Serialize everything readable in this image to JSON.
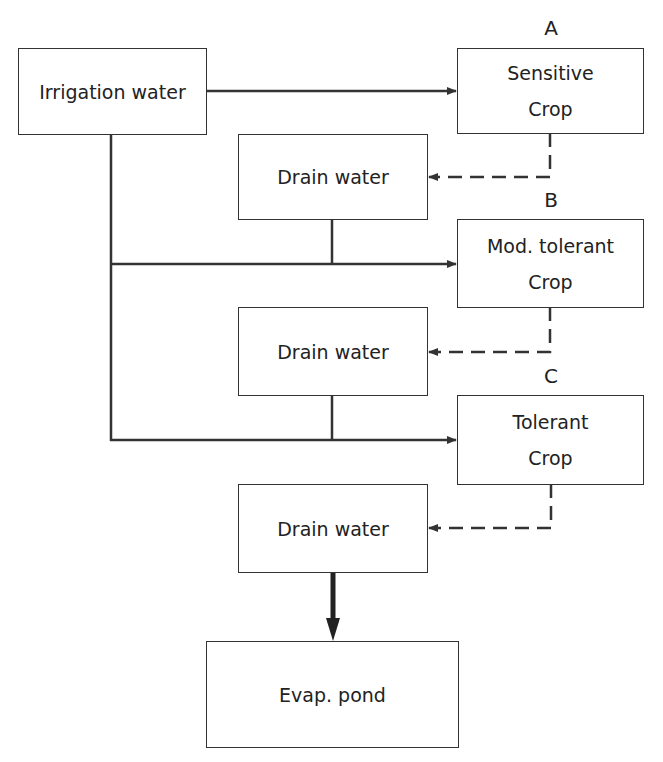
{
  "diagram": {
    "nodes": {
      "irrigation": {
        "label": "Irrigation water"
      },
      "sensitive": {
        "tag": "A",
        "line1": "Sensitive",
        "line2": "Crop"
      },
      "drain1": {
        "label": "Drain water"
      },
      "modtolerant": {
        "tag": "B",
        "line1": "Mod. tolerant",
        "line2": "Crop"
      },
      "drain2": {
        "label": "Drain water"
      },
      "tolerant": {
        "tag": "C",
        "line1": "Tolerant",
        "line2": "Crop"
      },
      "drain3": {
        "label": "Drain water"
      },
      "pond": {
        "label": "Evap. pond"
      }
    },
    "edges": [
      {
        "from": "Irrigation water",
        "to": "Sensitive Crop",
        "style": "solid"
      },
      {
        "from": "Sensitive Crop",
        "to": "Drain water (1)",
        "style": "dashed"
      },
      {
        "from": "Irrigation water + Drain water (1)",
        "to": "Mod. tolerant Crop",
        "style": "solid"
      },
      {
        "from": "Mod. tolerant Crop",
        "to": "Drain water (2)",
        "style": "dashed"
      },
      {
        "from": "Irrigation water + Drain water (2)",
        "to": "Tolerant Crop",
        "style": "solid"
      },
      {
        "from": "Tolerant Crop",
        "to": "Drain water (3)",
        "style": "dashed"
      },
      {
        "from": "Drain water (3)",
        "to": "Evap. pond",
        "style": "thick"
      }
    ]
  }
}
